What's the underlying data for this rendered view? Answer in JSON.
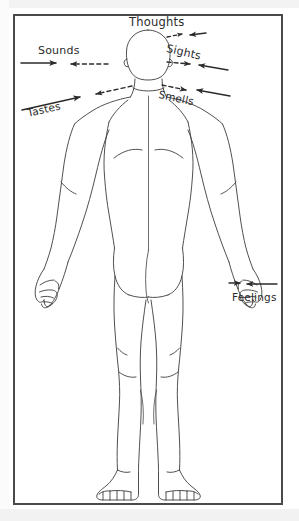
{
  "diagram": {
    "title_visible": false,
    "frame": {
      "border_color": "#4a4a4a",
      "background": "#ffffff"
    },
    "line_color": "#3a3a3a",
    "text_color": "#2b2b2b",
    "labels": [
      {
        "id": "thoughts",
        "text": "Thoughts",
        "orientation": "horizontal",
        "position": "above-head"
      },
      {
        "id": "sounds",
        "text": "Sounds",
        "orientation": "horizontal",
        "position": "left-of-head"
      },
      {
        "id": "sights",
        "text": "Sights",
        "orientation": "rotated-down-right",
        "position": "right-of-head"
      },
      {
        "id": "tastes",
        "text": "Tastes",
        "orientation": "rotated-up-right",
        "position": "lower-left-of-head"
      },
      {
        "id": "smells",
        "text": "Smells",
        "orientation": "rotated-down-right",
        "position": "lower-right-of-head"
      },
      {
        "id": "feelings",
        "text": "Feelings",
        "orientation": "horizontal",
        "position": "right-of-hand"
      }
    ],
    "arrows": [
      {
        "id": "thoughts-arrow",
        "style": "dashed-out-solid-in",
        "direction": "head-to-upper-right"
      },
      {
        "id": "sounds-arrow",
        "style": "solid-in-dashed-to-head",
        "direction": "left-to-head"
      },
      {
        "id": "sights-arrow",
        "style": "dashed-out-solid-in",
        "direction": "right-to-head"
      },
      {
        "id": "tastes-arrow",
        "style": "solid-in-dashed-to-head",
        "direction": "lower-left-to-head"
      },
      {
        "id": "smells-arrow",
        "style": "dashed-out-solid-in",
        "direction": "lower-right-to-head"
      },
      {
        "id": "feelings-arrow",
        "style": "solid-in-solid-in",
        "direction": "right-to-hand"
      }
    ]
  }
}
